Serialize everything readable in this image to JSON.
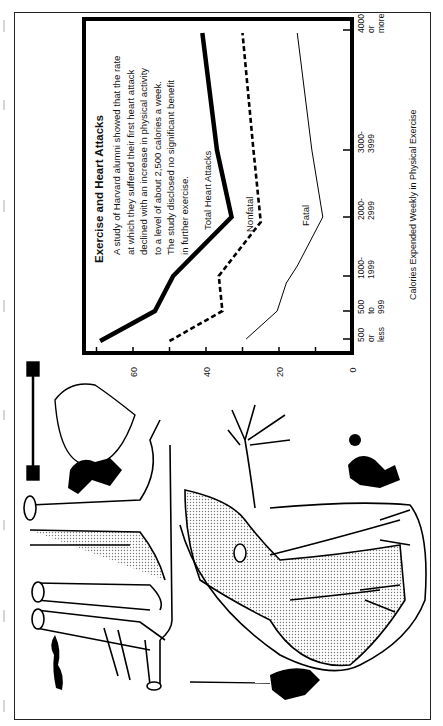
{
  "chart_data": {
    "type": "line",
    "orientation": "rotated-90-ccw",
    "title": "Exercise and Heart Attacks",
    "description": [
      "A study of Harvard alumni showed that the rate",
      "at which they suffered their first heart attack",
      "declined with an increase in physical activity",
      "to a level of about 2,500 calories a week.",
      "The study disclosed no significant benefit",
      "in further exercise."
    ],
    "xlabel": "Calories Expended Weekly in Physical Exercise",
    "ylabel": "",
    "categories": [
      "500 or less",
      "500 to 999",
      "1000-1999",
      "2000-2999",
      "3000-3999",
      "4000 or more"
    ],
    "category_tick_labels": [
      [
        "500",
        "or",
        "less"
      ],
      [
        "500",
        "to",
        "999"
      ],
      [
        "1000-",
        "1999"
      ],
      [
        "2000-",
        "2999"
      ],
      [
        "3000-",
        "3999"
      ],
      [
        "4000",
        "or",
        "more"
      ]
    ],
    "yticks": [
      0,
      10,
      20,
      30,
      40,
      50,
      60,
      70
    ],
    "ytick_labels": [
      "0",
      "",
      "20",
      "",
      "40",
      "",
      "60",
      ""
    ],
    "ylim": [
      0,
      70
    ],
    "grid": false,
    "legend": "inline labels",
    "series": [
      {
        "name": "Total Heart Attacks",
        "style": "thick-solid",
        "values": [
          69,
          54,
          49,
          33,
          37,
          41
        ]
      },
      {
        "name": "Nonfatal",
        "style": "dashed",
        "values": [
          50,
          35.5,
          36.5,
          25,
          27,
          30
        ]
      },
      {
        "name": "Fatal",
        "style": "thin-solid",
        "values": [
          29,
          20.5,
          15,
          8,
          11,
          15
        ]
      }
    ],
    "fatal_intermediate_points": [
      {
        "between": [
          "500 to 999",
          "1000-1999"
        ],
        "value": 18
      },
      {
        "between": [
          "1000-1999",
          "2000-2999"
        ],
        "value": 15
      }
    ]
  },
  "illustration": {
    "description": "Drawing of a heart and arteries with small figures exercising (weightlifting heart, climber, runner, tennis player, rope climber)"
  }
}
